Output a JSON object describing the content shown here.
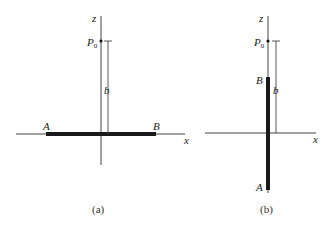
{
  "panels": [
    {
      "id": "a",
      "caption": "(a)",
      "axis_labels": {
        "z": "z",
        "x": "x"
      },
      "point_label": "P",
      "point_sub": "0",
      "distance_label": "b",
      "rod_end_labels": {
        "left": "A",
        "right": "B"
      },
      "rod_orientation": "horizontal, along x-axis"
    },
    {
      "id": "b",
      "caption": "(b)",
      "axis_labels": {
        "z": "z",
        "x": "x"
      },
      "point_label": "P",
      "point_sub": "0",
      "distance_label": "b",
      "rod_end_labels": {
        "top": "B",
        "bottom": "A"
      },
      "rod_orientation": "vertical, along z-axis"
    }
  ],
  "colors": {
    "line": "#333333",
    "rod": "#1a1a1a",
    "background": "#ffffff"
  }
}
